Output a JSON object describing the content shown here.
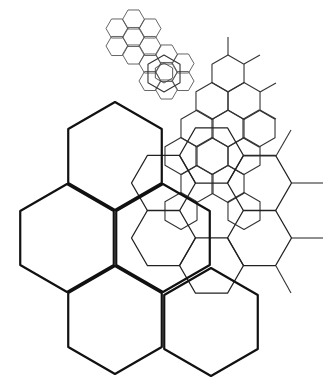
{
  "diagram": {
    "width": 335,
    "height": 392,
    "background": "#ffffff",
    "grids": [
      {
        "name": "large-pointy-grid",
        "orientation": "pointy",
        "radius": 54,
        "stroke": "#111111",
        "stroke_width": 2.2,
        "centers": [
          [
            115,
            156
          ],
          [
            67,
            238
          ],
          [
            163,
            238
          ],
          [
            115,
            320
          ],
          [
            211,
            322
          ]
        ]
      },
      {
        "name": "medium-flat-grid",
        "orientation": "flat",
        "radius": 32,
        "stroke": "#222222",
        "stroke_width": 1.3,
        "centers": [
          [
            211.5,
            155.5
          ],
          [
            163.5,
            183
          ],
          [
            259.5,
            183
          ],
          [
            163.5,
            238
          ],
          [
            259.5,
            238
          ],
          [
            211.5,
            265.5
          ]
        ]
      },
      {
        "name": "medium-pointy-grid",
        "orientation": "pointy",
        "radius": 18.5,
        "stroke": "#333333",
        "stroke_width": 1.1,
        "centers": [
          [
            228,
            73.5
          ],
          [
            212,
            101
          ],
          [
            244,
            101
          ],
          [
            197,
            128.5
          ],
          [
            228,
            128.5
          ],
          [
            259,
            128.5
          ],
          [
            212,
            156
          ],
          [
            244,
            156
          ],
          [
            181,
            156
          ],
          [
            164,
            73.5
          ],
          [
            197,
            184
          ],
          [
            228,
            184
          ],
          [
            244,
            211
          ],
          [
            181,
            211
          ]
        ]
      },
      {
        "name": "small-flat-grid",
        "orientation": "flat",
        "radius": 11,
        "stroke": "#555555",
        "stroke_width": 0.9,
        "centers": [
          [
            117,
            28.5
          ],
          [
            117,
            46
          ],
          [
            133.5,
            19.5
          ],
          [
            133.5,
            37
          ],
          [
            133.5,
            54.5
          ],
          [
            150,
            28.5
          ],
          [
            150,
            46
          ],
          [
            150,
            63.5
          ],
          [
            166.5,
            54.5
          ],
          [
            166.5,
            72
          ],
          [
            150,
            81
          ],
          [
            166.5,
            89.5
          ],
          [
            183,
            63.5
          ],
          [
            183,
            81
          ]
        ]
      },
      {
        "name": "inner-pointy-hex",
        "orientation": "pointy",
        "radius": 10,
        "stroke": "#444444",
        "stroke_width": 0.9,
        "centers": [
          [
            164,
            73
          ]
        ]
      }
    ],
    "stubs": {
      "stroke": "#333333",
      "stroke_width": 1.1,
      "lines": [
        [
          228,
          55,
          228,
          37
        ],
        [
          244,
          64,
          260,
          55
        ],
        [
          260,
          92,
          276,
          83
        ],
        [
          260,
          110,
          276,
          119
        ],
        [
          276,
          156,
          291,
          130
        ],
        [
          291,
          183,
          323,
          183
        ],
        [
          291,
          238,
          323,
          238
        ],
        [
          276,
          266,
          291,
          293
        ],
        [
          243,
          156,
          276,
          156
        ]
      ]
    }
  }
}
